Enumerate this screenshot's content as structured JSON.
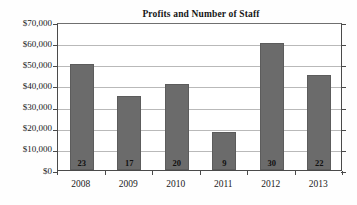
{
  "chart_data": {
    "type": "bar",
    "title": "Profits and Number of Staff",
    "xlabel": "",
    "ylabel": "",
    "categories": [
      "2008",
      "2009",
      "2010",
      "2011",
      "2012",
      "2013"
    ],
    "values": [
      50000,
      35000,
      40500,
      18000,
      60000,
      45000
    ],
    "bar_labels": [
      "23",
      "17",
      "20",
      "9",
      "30",
      "22"
    ],
    "series": [
      {
        "name": "Profits",
        "values": [
          50000,
          35000,
          40500,
          18000,
          60000,
          45000
        ]
      },
      {
        "name": "Number of Staff",
        "values": [
          23,
          17,
          20,
          9,
          30,
          22
        ]
      }
    ],
    "ylim": [
      0,
      70000
    ],
    "ytick_values": [
      0,
      10000,
      20000,
      30000,
      40000,
      50000,
      60000,
      70000
    ],
    "ytick_labels": [
      "$0",
      "$10,000",
      "$20,000",
      "$30,000",
      "$40,000",
      "$50,000",
      "$60,000",
      "$70,000"
    ],
    "grid": true,
    "legend": false,
    "bar_color": "#6b6b6b",
    "gridline_color": "#b9b9b9",
    "axis_color": "#4a4a4a",
    "background_color": "#ffffff"
  }
}
